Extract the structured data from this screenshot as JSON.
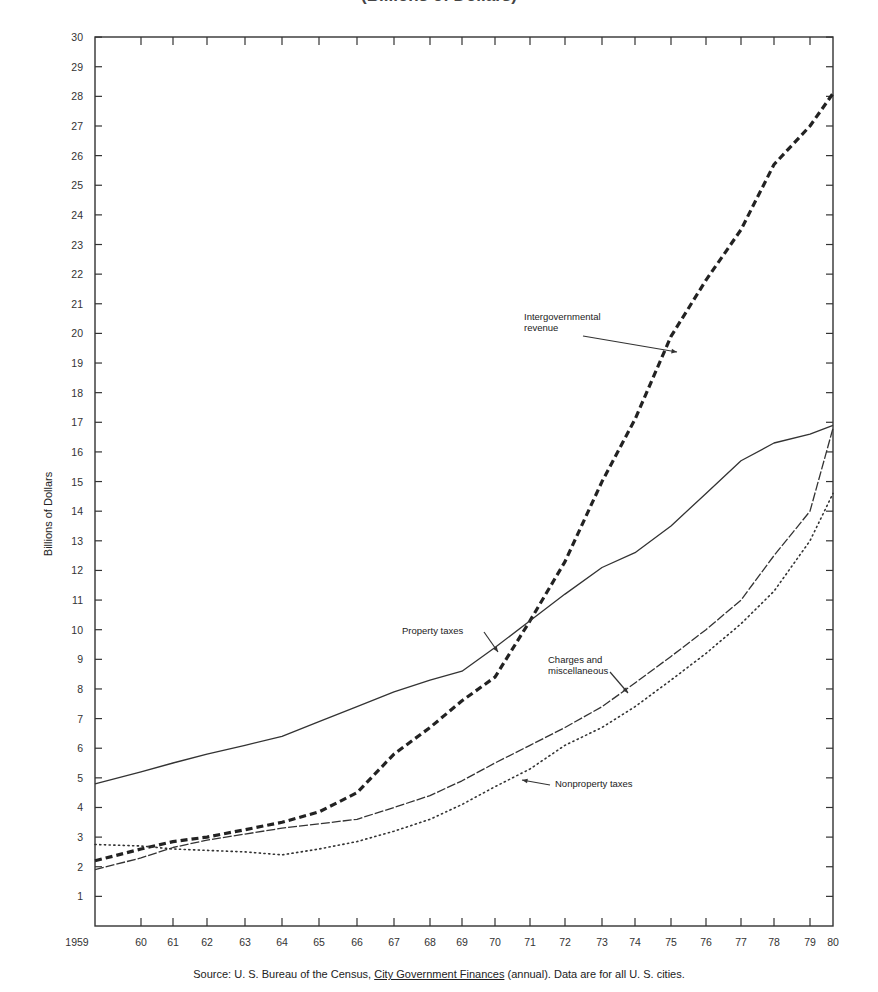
{
  "chart_data": {
    "type": "line",
    "title": "(Billions of Dollars)",
    "xlabel": "",
    "ylabel": "Billions of Dollars",
    "ylim": [
      0,
      30
    ],
    "xlim": [
      1959,
      1980
    ],
    "grid": false,
    "legend": "inline annotations",
    "x_tick_labels": [
      "1959",
      "60",
      "61",
      "62",
      "63",
      "64",
      "65",
      "66",
      "67",
      "68",
      "69",
      "70",
      "71",
      "72",
      "73",
      "74",
      "75",
      "76",
      "77",
      "78",
      "79",
      "80"
    ],
    "y_ticks": [
      1,
      2,
      3,
      4,
      5,
      6,
      7,
      8,
      9,
      10,
      11,
      12,
      13,
      14,
      15,
      16,
      17,
      18,
      19,
      20,
      21,
      22,
      23,
      24,
      25,
      26,
      27,
      28,
      29,
      30
    ],
    "x": [
      1959,
      1960,
      1961,
      1962,
      1963,
      1964,
      1965,
      1966,
      1967,
      1968,
      1969,
      1970,
      1971,
      1972,
      1973,
      1974,
      1975,
      1976,
      1977,
      1978,
      1979,
      1980
    ],
    "series": [
      {
        "name": "Intergovernmental revenue",
        "style": "heavy-dashed",
        "values": [
          2.2,
          2.6,
          2.85,
          3.0,
          3.25,
          3.5,
          3.85,
          4.5,
          5.8,
          6.7,
          7.6,
          8.4,
          10.3,
          12.3,
          15.0,
          17.1,
          19.9,
          21.8,
          23.5,
          25.7,
          27.0,
          28.1
        ]
      },
      {
        "name": "Property taxes",
        "style": "solid",
        "values": [
          4.8,
          5.2,
          5.5,
          5.8,
          6.1,
          6.4,
          6.9,
          7.4,
          7.9,
          8.3,
          8.6,
          9.4,
          10.3,
          11.2,
          12.1,
          12.6,
          13.5,
          14.6,
          15.7,
          16.3,
          16.6,
          16.9
        ]
      },
      {
        "name": "Charges and miscellaneous",
        "style": "dashed",
        "values": [
          1.9,
          2.3,
          2.65,
          2.9,
          3.1,
          3.3,
          3.45,
          3.6,
          4.0,
          4.4,
          4.9,
          5.5,
          6.1,
          6.7,
          7.4,
          8.2,
          9.1,
          10.0,
          11.0,
          12.5,
          14.0,
          16.8
        ]
      },
      {
        "name": "Nonproperty taxes",
        "style": "dotted",
        "values": [
          2.75,
          2.7,
          2.6,
          2.55,
          2.5,
          2.4,
          2.6,
          2.85,
          3.2,
          3.6,
          4.1,
          4.7,
          5.3,
          6.1,
          6.7,
          7.4,
          8.3,
          9.2,
          10.2,
          11.3,
          13.0,
          14.6
        ]
      }
    ],
    "annotations": [
      {
        "text": "Intergovernmental revenue",
        "lines": [
          "Intergovernmental",
          "revenue"
        ]
      },
      {
        "text": "Property taxes"
      },
      {
        "text": "Charges and miscellaneous",
        "lines": [
          "Charges and",
          "miscellaneous"
        ]
      },
      {
        "text": "Nonproperty taxes"
      }
    ]
  },
  "title_text": "(Billions of Dollars)",
  "ylabel_text": "Billions of Dollars",
  "annotations": {
    "intergov_1": "Intergovernmental",
    "intergov_2": "revenue",
    "property": "Property taxes",
    "charges_1": "Charges and",
    "charges_2": "miscellaneous",
    "nonproperty": "Nonproperty taxes"
  },
  "source": {
    "prefix": "Source:  U. S. Bureau of the Census, ",
    "publication": "City Government Finances",
    "suffix": " (annual). Data are for all U. S. cities."
  },
  "layout": {
    "x_px": [
      95,
      141,
      173,
      207,
      245,
      282,
      319,
      357,
      394,
      430,
      462,
      495,
      530,
      565,
      602,
      635,
      671,
      706,
      741,
      774,
      810,
      833
    ],
    "y0": 926,
    "ypx_per_unit": 29.63,
    "plot_left": 95,
    "plot_right": 833,
    "plot_top": 37,
    "plot_bottom": 926
  }
}
